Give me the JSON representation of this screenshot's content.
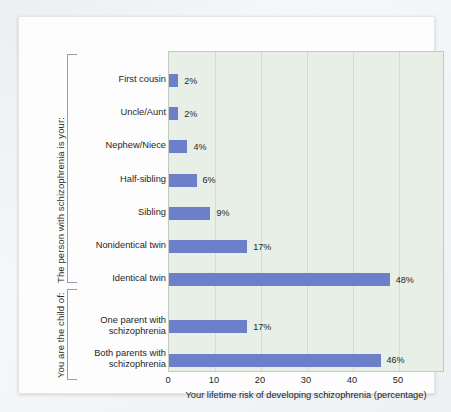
{
  "chart_data": {
    "type": "bar",
    "orientation": "horizontal",
    "title": "",
    "xlabel": "Your lifetime risk of developing schizophrenia (percentage)",
    "ylabel": "",
    "xlim": [
      0,
      60
    ],
    "xticks": [
      0,
      10,
      20,
      30,
      40,
      50
    ],
    "xtick_labels": [
      "0",
      "10",
      "20",
      "30",
      "40",
      "50"
    ],
    "grid": true,
    "legend": "none",
    "bar_color": "#6b80c8",
    "plot_background": "#e7efe7",
    "categories": [
      "First cousin",
      "Uncle/Aunt",
      "Nephew/Niece",
      "Half-sibling",
      "Sibling",
      "Nonidentical twin",
      "Identical twin",
      "One parent with schizophrenia",
      "Both parents with schizophrenia"
    ],
    "values": [
      2,
      2,
      4,
      6,
      9,
      17,
      48,
      17,
      46
    ],
    "value_labels": [
      "2%",
      "2%",
      "4%",
      "6%",
      "9%",
      "17%",
      "48%",
      "17%",
      "46%"
    ],
    "groups": [
      {
        "caption": "The person with schizophrenia is your:",
        "categories": [
          "First cousin",
          "Uncle/Aunt",
          "Nephew/Niece",
          "Half-sibling",
          "Sibling",
          "Nonidentical twin",
          "Identical twin"
        ]
      },
      {
        "caption": "You are the child of:",
        "categories": [
          "One parent with schizophrenia",
          "Both parents with schizophrenia"
        ]
      }
    ],
    "bars": [
      {
        "label_lines": [
          "First cousin"
        ],
        "value": 2,
        "value_label": "2%",
        "group": 0
      },
      {
        "label_lines": [
          "Uncle/Aunt"
        ],
        "value": 2,
        "value_label": "2%",
        "group": 0
      },
      {
        "label_lines": [
          "Nephew/Niece"
        ],
        "value": 4,
        "value_label": "4%",
        "group": 0
      },
      {
        "label_lines": [
          "Half-sibling"
        ],
        "value": 6,
        "value_label": "6%",
        "group": 0
      },
      {
        "label_lines": [
          "Sibling"
        ],
        "value": 9,
        "value_label": "9%",
        "group": 0
      },
      {
        "label_lines": [
          "Nonidentical twin"
        ],
        "value": 17,
        "value_label": "17%",
        "group": 0
      },
      {
        "label_lines": [
          "Identical twin"
        ],
        "value": 48,
        "value_label": "48%",
        "group": 0
      },
      {
        "label_lines": [
          "One parent with",
          "schizophrenia"
        ],
        "value": 17,
        "value_label": "17%",
        "group": 1
      },
      {
        "label_lines": [
          "Both parents with",
          "schizophrenia"
        ],
        "value": 46,
        "value_label": "46%",
        "group": 1
      }
    ]
  }
}
